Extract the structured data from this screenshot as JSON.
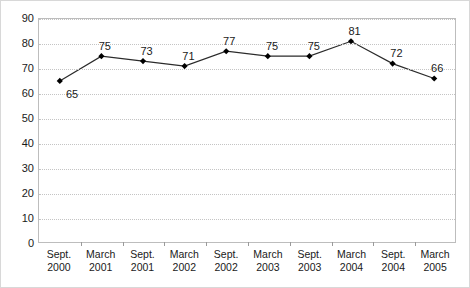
{
  "chart_data": {
    "type": "line",
    "title": "",
    "subtitle": "",
    "xlabel": "",
    "ylabel": "",
    "ylim": [
      0,
      90
    ],
    "ytick_step": 10,
    "yticks": [
      90,
      80,
      70,
      60,
      50,
      40,
      30,
      20,
      10,
      0
    ],
    "grid": true,
    "legend": "none",
    "categories": [
      "Sept.\n2000",
      "March\n2001",
      "Sept.\n2001",
      "March\n2002",
      "Sept.\n2002",
      "March\n2003",
      "Sept.\n2003",
      "March\n2004",
      "Sept.\n2004",
      "March\n2005"
    ],
    "values": [
      65,
      75,
      73,
      71,
      77,
      75,
      75,
      81,
      72,
      66
    ],
    "point_labels": [
      "65",
      "75",
      "73",
      "71",
      "77",
      "75",
      "75",
      "81",
      "72",
      "66"
    ],
    "series": [
      {
        "name": "series-1",
        "values": [
          65,
          75,
          73,
          71,
          77,
          75,
          75,
          81,
          72,
          66
        ],
        "line_color": "#2b2b2b",
        "marker": "diamond",
        "marker_color": "#000000"
      }
    ],
    "colors": {
      "line": "#2b2b2b",
      "marker": "#000000",
      "gridline": "#c4c4c4",
      "axis": "#bdbdbd",
      "text": "#1a1a1a",
      "background": "#ffffff",
      "border": "#d8d8d8"
    }
  }
}
